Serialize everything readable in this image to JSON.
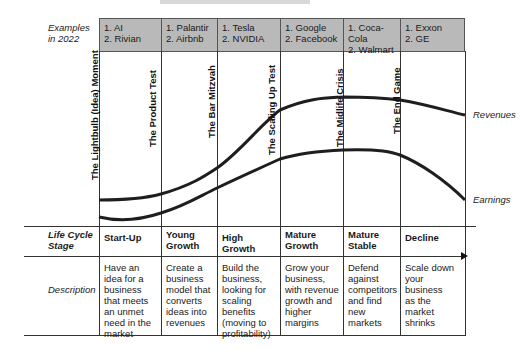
{
  "diagram": {
    "type": "corporate-life-cycle",
    "row_labels": {
      "examples": "Examples\nin 2022",
      "stage": "Life Cycle\nStage",
      "description": "Description"
    },
    "columns": [
      {
        "examples": [
          "1. AI",
          "2. Rivian"
        ],
        "stage": "Start-Up",
        "description": "Have an idea for a business that meets an unmet need in the market"
      },
      {
        "examples": [
          "1. Palantir",
          "2. Airbnb"
        ],
        "stage": "Young Growth",
        "description": "Create a business model that converts ideas into revenues"
      },
      {
        "examples": [
          "1. Tesla",
          "2. NVIDIA"
        ],
        "stage": "High Growth",
        "description": "Build the business, looking for scaling benefits (moving to profitability)"
      },
      {
        "examples": [
          "1. Google",
          "2. Facebook"
        ],
        "stage": "Mature Growth",
        "description": "Grow your business, with revenue growth and higher margins"
      },
      {
        "examples": [
          "1. Coca-Cola",
          "2. Walmart"
        ],
        "stage": "Mature Stable",
        "description": "Defend against competitors and find new markets"
      },
      {
        "examples": [
          "1. Exxon",
          "2. GE"
        ],
        "stage": "Decline",
        "description": "Scale down your business as the market shrinks"
      }
    ],
    "transitions": [
      "The Lightbulb (Idea) Moment",
      "The Product Test",
      "The Bar Mitzvah",
      "The Scaling Up Test",
      "The Midlife Crisis",
      "The End Game"
    ],
    "curves": {
      "revenues_label": "Revenues",
      "earnings_label": "Earnings"
    }
  }
}
